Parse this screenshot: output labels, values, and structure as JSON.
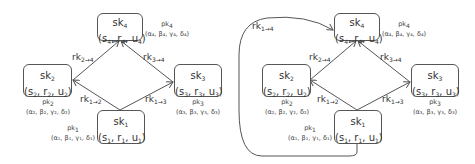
{
  "diagrams": [
    {
      "nodes": {
        "sk4": {
          "name": "sk",
          "idx": "4",
          "s": "s",
          "r": "r",
          "u": "u",
          "sub": "4",
          "pk": "pk",
          "pk_idx": "4",
          "params": "(α₄, β₄, γ₄, δ₄)"
        },
        "sk2": {
          "name": "sk",
          "idx": "2",
          "s": "s",
          "r": "r",
          "u": "u",
          "sub": "2",
          "pk": "pk",
          "pk_idx": "2",
          "params": "(α₂, β₂, γ₂, δ₂)"
        },
        "sk3": {
          "name": "sk",
          "idx": "3",
          "s": "s",
          "r": "r",
          "u": "u",
          "sub": "3",
          "pk": "pk",
          "pk_idx": "3",
          "params": "(α₃, β₃, γ₃, δ₃)"
        },
        "sk1": {
          "name": "sk",
          "idx": "1",
          "s": "s",
          "r": "r",
          "u": "u",
          "sub": "1",
          "pk": "pk",
          "pk_idx": "1",
          "params": "(α₁, β₁, γ₁, δ₁)"
        }
      },
      "edges": {
        "rk24": {
          "base": "rk",
          "sub": "2→4"
        },
        "rk34": {
          "base": "rk",
          "sub": "3→4"
        },
        "rk12": {
          "base": "rk",
          "sub": "1→2"
        },
        "rk13": {
          "base": "rk",
          "sub": "1→3"
        }
      }
    },
    {
      "nodes": {
        "sk4": {
          "name": "sk",
          "idx": "4",
          "s": "s",
          "r": "r",
          "u": "u",
          "sub": "4",
          "pk": "pk",
          "pk_idx": "4",
          "params": "(α₄, β₄, γ₄, δ₄)"
        },
        "sk2": {
          "name": "sk",
          "idx": "2",
          "s": "s",
          "r": "r",
          "u": "u",
          "sub": "2",
          "pk": "pk",
          "pk_idx": "2",
          "params": "(α₂, β₂, γ₂, δ₂)"
        },
        "sk3": {
          "name": "sk",
          "idx": "3",
          "s": "s",
          "r": "r",
          "u": "u",
          "sub": "3",
          "pk": "pk",
          "pk_idx": "3",
          "params": "(α₃, β₃, γ₃, δ₃)"
        },
        "sk1": {
          "name": "sk",
          "idx": "1",
          "s": "s",
          "r": "r",
          "u": "u",
          "sub": "1",
          "pk": "pk",
          "pk_idx": "1",
          "params": "(α₁, β₁, γ₁, δ₁)"
        }
      },
      "edges": {
        "rk24": {
          "base": "rk",
          "sub": "2→4"
        },
        "rk34": {
          "base": "rk",
          "sub": "3→4"
        },
        "rk12": {
          "base": "rk",
          "sub": "1→2"
        },
        "rk13": {
          "base": "rk",
          "sub": "1→3"
        },
        "rk14": {
          "base": "rk",
          "sub": "1→4"
        }
      }
    }
  ]
}
